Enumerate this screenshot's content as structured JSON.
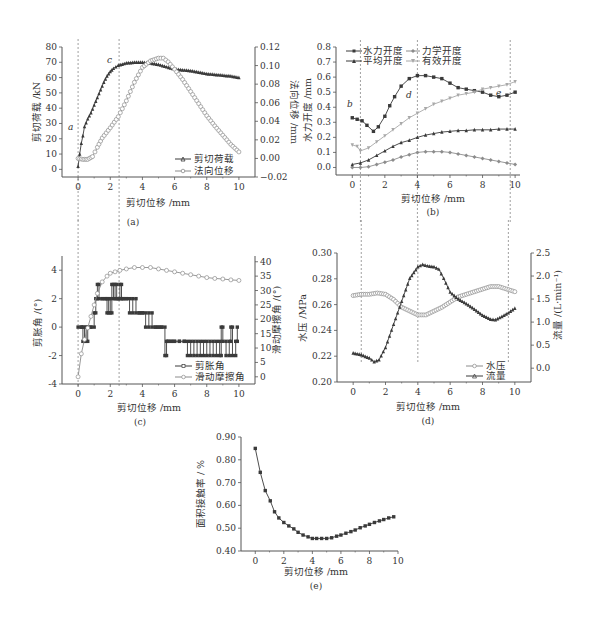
{
  "figure": {
    "colors": {
      "axis": "#555555",
      "dark": "#3a3a3a",
      "gray": "#8c8c8c",
      "light": "#a8a8a8",
      "guide": "#888888"
    }
  },
  "chart_data": [
    {
      "id": "a",
      "type": "line",
      "caption": "(a)",
      "xlabel": "剪切位移 /mm",
      "ylabel": "剪切荷载 /kN",
      "y2label": "法向位移 /mm",
      "xlim": [
        -1,
        11
      ],
      "ylim": [
        -5,
        80
      ],
      "y2lim": [
        -0.02,
        0.12
      ],
      "xticks": [
        0,
        2,
        4,
        6,
        8,
        10
      ],
      "yticks": [
        0,
        10,
        20,
        30,
        40,
        50,
        60,
        70,
        80
      ],
      "y2ticks": [
        -0.02,
        0.0,
        0.02,
        0.04,
        0.06,
        0.08,
        0.1,
        0.12
      ],
      "y2tick_labels": [
        "−0.02",
        "0.00",
        "0.02",
        "0.04",
        "0.06",
        "0.08",
        "0.10",
        "0.12"
      ],
      "guides_x": [
        0,
        2.55
      ],
      "annotations": [
        {
          "text": "a",
          "x": -0.45,
          "y": 28
        },
        {
          "text": "c",
          "x": 2.0,
          "y": 73
        }
      ],
      "legend": {
        "position": "bottom-right",
        "entries": [
          "剪切荷载",
          "法向位移"
        ]
      },
      "series": [
        {
          "name": "剪切荷载",
          "axis": "left",
          "marker": "triangle",
          "color": "dark",
          "x": [
            0,
            0.1,
            0.2,
            0.3,
            0.4,
            0.6,
            0.8,
            1.0,
            1.2,
            1.4,
            1.6,
            1.8,
            2.0,
            2.2,
            2.5,
            3.0,
            3.5,
            4.0,
            4.5,
            5.0,
            5.5,
            6.0,
            6.5,
            7.0,
            7.5,
            8.0,
            8.5,
            9.0,
            9.5,
            10.0
          ],
          "y": [
            2,
            10,
            17,
            22,
            28,
            33,
            37,
            42,
            47,
            52,
            57,
            61,
            64,
            66,
            68,
            69.5,
            70,
            70,
            69.5,
            68.5,
            67,
            65.5,
            65,
            64.5,
            63.5,
            62.5,
            62,
            61.5,
            61,
            60
          ]
        },
        {
          "name": "法向位移",
          "axis": "right",
          "marker": "circle",
          "color": "gray",
          "x": [
            0,
            0.3,
            0.6,
            0.9,
            1.2,
            1.5,
            2.0,
            2.5,
            3.0,
            3.5,
            4.0,
            4.5,
            5.0,
            5.3,
            5.6,
            6.0,
            6.5,
            7.0,
            7.5,
            8.0,
            8.5,
            9.0,
            9.5,
            10.0
          ],
          "y": [
            0.0,
            -0.001,
            -0.001,
            0.002,
            0.012,
            0.022,
            0.033,
            0.045,
            0.062,
            0.082,
            0.098,
            0.105,
            0.108,
            0.108,
            0.104,
            0.096,
            0.085,
            0.072,
            0.059,
            0.046,
            0.035,
            0.025,
            0.015,
            0.007
          ]
        }
      ]
    },
    {
      "id": "b",
      "type": "line",
      "caption": "(b)",
      "xlabel": "剪切位移 /mm",
      "ylabel": "水力开度 /mm",
      "xlim": [
        -1,
        10.3
      ],
      "ylim": [
        -0.05,
        0.8
      ],
      "xticks": [
        0,
        2,
        4,
        6,
        8,
        10
      ],
      "yticks": [
        0.0,
        0.1,
        0.2,
        0.3,
        0.4,
        0.5,
        0.6,
        0.7,
        0.8
      ],
      "guides_x": [
        0.5,
        4.0,
        9.7
      ],
      "annotations": [
        {
          "text": "b",
          "x": -0.3,
          "y": 0.42
        },
        {
          "text": "d",
          "x": 3.4,
          "y": 0.47
        },
        {
          "text": "e",
          "x": 9.3,
          "y": 0.51
        }
      ],
      "legend": {
        "position": "top",
        "entries": [
          "水力开度",
          "力学开度",
          "平均开度",
          "有效开度"
        ]
      },
      "series": [
        {
          "name": "水力开度",
          "marker": "square",
          "color": "dark",
          "x": [
            0,
            0.3,
            0.6,
            0.9,
            1.3,
            1.6,
            2.0,
            2.3,
            2.6,
            3.0,
            3.5,
            4.0,
            4.5,
            5.0,
            5.5,
            6.0,
            6.5,
            7.0,
            7.5,
            8.0,
            8.5,
            9.0,
            9.5,
            10.0
          ],
          "y": [
            0.33,
            0.32,
            0.31,
            0.28,
            0.24,
            0.27,
            0.34,
            0.41,
            0.47,
            0.54,
            0.59,
            0.61,
            0.61,
            0.6,
            0.59,
            0.56,
            0.53,
            0.52,
            0.51,
            0.5,
            0.48,
            0.47,
            0.48,
            0.5
          ]
        },
        {
          "name": "力学开度",
          "marker": "diamond",
          "color": "gray",
          "x": [
            0,
            0.5,
            1.0,
            1.5,
            2.0,
            2.5,
            3.0,
            3.5,
            4.0,
            4.5,
            5.0,
            5.5,
            6.0,
            6.5,
            7.0,
            7.5,
            8.0,
            8.5,
            9.0,
            9.5,
            10.0
          ],
          "y": [
            0.0,
            0.0,
            0.005,
            0.02,
            0.035,
            0.05,
            0.07,
            0.085,
            0.1,
            0.105,
            0.105,
            0.105,
            0.1,
            0.09,
            0.08,
            0.07,
            0.06,
            0.05,
            0.04,
            0.03,
            0.02
          ]
        },
        {
          "name": "平均开度",
          "marker": "triangle",
          "color": "dark",
          "x": [
            0,
            0.5,
            1.0,
            1.5,
            2.0,
            2.5,
            3.0,
            3.5,
            4.0,
            4.5,
            5.0,
            5.5,
            6.0,
            6.5,
            7.0,
            7.5,
            8.0,
            8.5,
            9.0,
            9.5,
            10.0
          ],
          "y": [
            0.02,
            0.03,
            0.05,
            0.08,
            0.11,
            0.14,
            0.165,
            0.18,
            0.2,
            0.215,
            0.225,
            0.235,
            0.24,
            0.245,
            0.245,
            0.25,
            0.25,
            0.25,
            0.255,
            0.255,
            0.255
          ]
        },
        {
          "name": "有效开度",
          "marker": "inverted-triangle",
          "color": "light",
          "x": [
            0,
            0.3,
            0.5,
            1.0,
            1.5,
            2.0,
            2.5,
            3.0,
            3.5,
            4.0,
            4.5,
            5.0,
            5.5,
            6.0,
            6.5,
            7.0,
            7.5,
            8.0,
            8.5,
            9.0,
            9.5,
            10.0
          ],
          "y": [
            0.15,
            0.14,
            0.11,
            0.13,
            0.17,
            0.21,
            0.25,
            0.29,
            0.33,
            0.36,
            0.39,
            0.42,
            0.44,
            0.46,
            0.48,
            0.49,
            0.5,
            0.52,
            0.53,
            0.54,
            0.55,
            0.57
          ]
        }
      ]
    },
    {
      "id": "c",
      "type": "line",
      "caption": "(c)",
      "xlabel": "剪切位移 /mm",
      "ylabel": "剪胀角 /(°)",
      "y2label": "滑动摩擦角 /(°)",
      "xlim": [
        -1,
        11
      ],
      "ylim": [
        -4,
        5
      ],
      "y2lim": [
        -2.5,
        42
      ],
      "xticks": [
        0,
        2,
        4,
        6,
        8,
        10
      ],
      "yticks": [
        -4,
        -2,
        0,
        2,
        4
      ],
      "y2ticks": [
        0,
        5,
        10,
        15,
        20,
        25,
        30,
        35,
        40
      ],
      "guides_x": [
        0,
        2.55
      ],
      "legend": {
        "position": "bottom-right",
        "entries": [
          "剪胀角",
          "滑动摩擦角"
        ]
      },
      "series": [
        {
          "name": "剪胀角",
          "axis": "left",
          "marker": "square",
          "color": "dark",
          "style": "step",
          "x": [
            0,
            0.2,
            0.3,
            0.4,
            0.5,
            0.6,
            0.8,
            1.0,
            1.1,
            1.2,
            1.3,
            1.5,
            1.7,
            1.8,
            1.9,
            2.0,
            2.1,
            2.2,
            2.3,
            2.4,
            2.5,
            2.6,
            2.7,
            2.8,
            3.0,
            3.2,
            3.4,
            3.6,
            3.8,
            4.0,
            4.2,
            4.4,
            4.6,
            4.8,
            5.0,
            5.2,
            5.4,
            5.5,
            5.6,
            5.8,
            6.0,
            6.3,
            6.6,
            6.8,
            7.0,
            7.2,
            7.4,
            7.6,
            7.8,
            8.0,
            8.2,
            8.4,
            8.6,
            8.8,
            8.9,
            9.0,
            9.2,
            9.4,
            9.5,
            9.6,
            9.8,
            9.9
          ],
          "y": [
            0,
            0,
            -1,
            0,
            -1,
            0,
            0,
            1,
            2,
            3,
            2,
            2,
            2,
            1,
            2,
            1,
            3,
            2,
            3,
            2,
            2,
            3,
            2,
            2,
            2,
            1,
            2,
            1,
            1,
            1,
            0,
            1,
            0,
            0,
            0,
            0,
            -2,
            -1,
            -1,
            -1,
            -1,
            -1,
            -1,
            -2,
            -1,
            -2,
            -1,
            -2,
            -1,
            -2,
            -1,
            -2,
            -1,
            -2,
            0,
            -1,
            -2,
            -1,
            0,
            -2,
            -1,
            0
          ]
        },
        {
          "name": "滑动摩擦角",
          "axis": "right",
          "marker": "circle",
          "color": "gray",
          "x": [
            0,
            0.2,
            0.4,
            0.6,
            0.8,
            1.0,
            1.2,
            1.5,
            1.8,
            2.0,
            2.3,
            2.6,
            3.0,
            3.5,
            4.0,
            4.5,
            5.0,
            5.5,
            6.0,
            6.5,
            7.0,
            7.5,
            8.0,
            8.5,
            9.0,
            9.5,
            10.0
          ],
          "y": [
            0,
            8,
            13,
            17,
            21,
            25,
            29,
            33,
            35,
            36,
            36.5,
            37,
            37.5,
            38,
            38,
            38,
            37.5,
            37,
            36.5,
            36,
            35.5,
            35,
            34.5,
            34.2,
            34,
            33.7,
            33.5
          ]
        }
      ]
    },
    {
      "id": "d",
      "type": "line",
      "caption": "(d)",
      "xlabel": "剪切位移 /mm",
      "ylabel": "水压 /MPa",
      "y2label": "流量 /(L·min⁻¹)",
      "xlim": [
        -1,
        11
      ],
      "ylim": [
        0.2,
        0.3
      ],
      "y2lim": [
        -0.3,
        2.5
      ],
      "xticks": [
        0,
        2,
        4,
        6,
        8,
        10
      ],
      "yticks": [
        0.2,
        0.22,
        0.24,
        0.26,
        0.28,
        0.3
      ],
      "y2ticks": [
        0.0,
        0.5,
        1.0,
        1.5,
        2.0,
        2.5
      ],
      "guides_x": [
        0.5,
        4.0,
        9.6
      ],
      "legend": {
        "position": "bottom-right",
        "entries": [
          "水压",
          "流量"
        ]
      },
      "series": [
        {
          "name": "水压",
          "axis": "left",
          "marker": "circle",
          "color": "gray",
          "x": [
            0,
            0.5,
            1.0,
            1.5,
            2.0,
            2.5,
            3.0,
            3.5,
            4.0,
            4.5,
            5.0,
            5.5,
            6.0,
            6.5,
            7.0,
            7.5,
            8.0,
            8.5,
            9.0,
            9.5,
            10.0
          ],
          "y": [
            0.267,
            0.268,
            0.268,
            0.269,
            0.268,
            0.264,
            0.258,
            0.255,
            0.252,
            0.252,
            0.255,
            0.258,
            0.262,
            0.266,
            0.268,
            0.27,
            0.272,
            0.274,
            0.274,
            0.272,
            0.27
          ]
        },
        {
          "name": "流量",
          "axis": "right",
          "marker": "triangle",
          "color": "dark",
          "x": [
            0,
            0.5,
            1.0,
            1.3,
            1.6,
            2.0,
            2.5,
            3.0,
            3.5,
            4.0,
            4.3,
            4.6,
            5.0,
            5.3,
            5.6,
            6.0,
            6.5,
            7.0,
            7.5,
            8.0,
            8.5,
            8.8,
            9.2,
            9.6,
            10.0
          ],
          "y": [
            0.33,
            0.29,
            0.22,
            0.14,
            0.18,
            0.45,
            0.95,
            1.45,
            1.95,
            2.2,
            2.25,
            2.22,
            2.2,
            2.15,
            1.95,
            1.65,
            1.5,
            1.4,
            1.28,
            1.15,
            1.06,
            1.05,
            1.12,
            1.2,
            1.3
          ]
        }
      ]
    },
    {
      "id": "e",
      "type": "line",
      "caption": "(e)",
      "xlabel": "剪切位移 /mm",
      "ylabel": "面积接触率 / %",
      "xlim": [
        -1,
        10
      ],
      "ylim": [
        0.4,
        0.9
      ],
      "xticks": [
        0,
        2,
        4,
        6,
        8,
        10
      ],
      "yticks": [
        0.4,
        0.5,
        0.6,
        0.7,
        0.8,
        0.9
      ],
      "series": [
        {
          "name": "面积接触率",
          "marker": "square",
          "color": "dark",
          "x": [
            0,
            0.35,
            0.7,
            1.05,
            1.35,
            1.65,
            2.0,
            2.35,
            2.7,
            3.0,
            3.35,
            3.7,
            4.0,
            4.3,
            4.65,
            5.0,
            5.35,
            5.7,
            6.0,
            6.35,
            6.7,
            7.0,
            7.35,
            7.7,
            8.0,
            8.35,
            8.7,
            9.0,
            9.35,
            9.7
          ],
          "y": [
            0.85,
            0.745,
            0.665,
            0.62,
            0.572,
            0.545,
            0.525,
            0.51,
            0.497,
            0.482,
            0.47,
            0.462,
            0.455,
            0.455,
            0.455,
            0.455,
            0.458,
            0.465,
            0.47,
            0.478,
            0.485,
            0.492,
            0.502,
            0.51,
            0.517,
            0.525,
            0.532,
            0.538,
            0.545,
            0.55
          ]
        }
      ]
    }
  ]
}
